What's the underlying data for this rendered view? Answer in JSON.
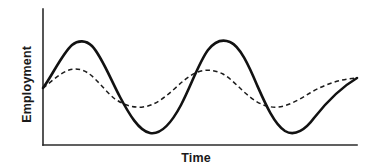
{
  "chart_data": {
    "type": "line",
    "title": "",
    "subtitle": "",
    "xlabel": "Time",
    "ylabel": "Employment",
    "grid": false,
    "legend": "none",
    "xlim": [
      0,
      100
    ],
    "ylim": [
      0,
      100
    ],
    "x_tick_labels": [],
    "y_tick_labels": [],
    "annotations": [],
    "series": [
      {
        "name": "high-amplitude employment cycle",
        "style": "solid",
        "color": "#121212",
        "x": [
          0,
          5,
          10,
          15,
          20,
          25,
          30,
          35,
          40,
          45,
          50,
          55,
          60,
          65,
          70,
          75,
          80,
          85,
          90,
          95,
          100
        ],
        "values": [
          41,
          54,
          68,
          79,
          86,
          87,
          82,
          71,
          57,
          41,
          26,
          15,
          9,
          9,
          16,
          30,
          48,
          66,
          81,
          88,
          87
        ]
      },
      {
        "name": "low-amplitude employment cycle",
        "style": "dashed",
        "color": "#1c1c1c",
        "x": [
          0,
          5,
          10,
          15,
          20,
          25,
          30,
          35,
          40,
          45,
          50,
          55,
          60,
          65,
          70,
          75,
          80,
          85,
          90,
          95,
          100
        ],
        "values": [
          41,
          50,
          57,
          61,
          62,
          61,
          57,
          52,
          46,
          41,
          37,
          34,
          33,
          34,
          38,
          44,
          51,
          57,
          61,
          62,
          60
        ]
      }
    ]
  },
  "labels": {
    "y_axis": "Employment",
    "x_axis": "Time"
  },
  "paths": {
    "x_axis": "M 43 145 L 357 145",
    "y_axis": "M 43 9 L 43 145",
    "solid_curve": "M 43 88 C 52 76 62 54 72 45 C 78 40 86 40 92 46 C 101 55 110 78 120 97 C 129 114 139 131 150 133 C 161 135 172 122 181 105 C 191 86 199 62 208 50 C 215 41 223 39 230 42 C 240 46 249 66 257 85 C 265 103 274 124 285 131 C 295 137 306 129 314 118 C 325 104 340 88 357 78",
    "dashed_curve": "M 43 88 C 51 82 60 73 69 70 C 75 68 82 69 88 73 C 97 79 106 92 115 99 C 124 105 133 108 143 107 C 153 106 163 99 172 91 C 181 83 189 75 198 72 C 206 69 215 70 223 74 C 232 79 241 90 250 97 C 259 104 268 108 278 107 C 289 106 300 99 310 93 C 325 84 341 79 357 78"
  }
}
